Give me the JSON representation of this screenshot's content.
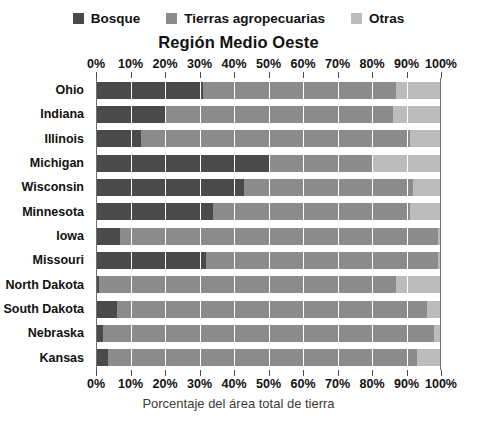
{
  "chart_data": {
    "type": "bar",
    "orientation": "horizontal",
    "stacked": true,
    "stacked_mode": "percent",
    "title": "Región Medio Oeste",
    "subtitle": "",
    "xlabel": "Porcentaje del área total de tierra",
    "ylabel": "",
    "xlim": [
      0,
      100
    ],
    "grid": true,
    "grid_axis": "x",
    "legend_position": "top",
    "tick_labels": [
      "0%",
      "10%",
      "20%",
      "30%",
      "40%",
      "50%",
      "60%",
      "70%",
      "80%",
      "90%",
      "100%"
    ],
    "tick_values": [
      0,
      10,
      20,
      30,
      40,
      50,
      60,
      70,
      80,
      90,
      100
    ],
    "categories": [
      "Ohio",
      "Indiana",
      "Illinois",
      "Michigan",
      "Wisconsin",
      "Minnesota",
      "Iowa",
      "Missouri",
      "North Dakota",
      "South Dakota",
      "Nebraska",
      "Kansas"
    ],
    "series": [
      {
        "name": "Bosque",
        "color": "#4a4a4a",
        "values": [
          31,
          20,
          13,
          50,
          43,
          34,
          7,
          32,
          1,
          6,
          2,
          3.5
        ]
      },
      {
        "name": "Tierras agropecuarias",
        "color": "#8c8c8c",
        "values": [
          56,
          66,
          78,
          30,
          49,
          57,
          92,
          67,
          86,
          90,
          96,
          89.5
        ]
      },
      {
        "name": "Otras",
        "color": "#bcbcbc",
        "values": [
          13,
          14,
          9,
          20,
          8,
          9,
          1,
          1,
          13,
          4,
          2,
          7
        ]
      }
    ]
  },
  "legend": {
    "items": [
      {
        "label": "Bosque",
        "color": "#4a4a4a"
      },
      {
        "label": "Tierras agropecuarias",
        "color": "#8c8c8c"
      },
      {
        "label": "Otras",
        "color": "#bcbcbc"
      }
    ]
  },
  "colors": {
    "forest": "#4a4a4a",
    "farmland": "#8c8c8c",
    "other": "#bcbcbc",
    "axis": "#6e6e6e",
    "text": "#111111",
    "caption": "#3c3c3c",
    "background": "#ffffff"
  }
}
